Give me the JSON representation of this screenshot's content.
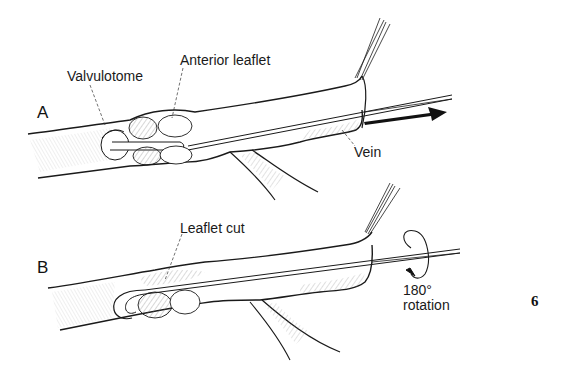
{
  "figure": {
    "number": "6",
    "style": "black-and-white pen-and-ink surgical illustration",
    "colors": {
      "ink": "#1a1a1a",
      "background": "#ffffff",
      "hatch": "#555555"
    }
  },
  "panels": [
    {
      "id": "A",
      "label": "A",
      "annotations": [
        {
          "text": "Valvulotome",
          "target": "valvulotome cutting head inside vein"
        },
        {
          "text": "Anterior leaflet",
          "target": "valve leaflet inside vein"
        },
        {
          "text": "Vein",
          "target": "vein wall at cut end"
        }
      ],
      "arrow": {
        "direction": "right",
        "meaning": "valvulotome pulled outward through vein"
      }
    },
    {
      "id": "B",
      "label": "B",
      "annotations": [
        {
          "text": "Leaflet cut",
          "target": "cut valve leaflet"
        },
        {
          "text": "180°",
          "target": "rotation indicator"
        },
        {
          "text": "rotation",
          "target": "rotation indicator"
        }
      ],
      "rotation_indicator": {
        "degrees": "180°",
        "icon": "circular-arrow"
      }
    }
  ]
}
